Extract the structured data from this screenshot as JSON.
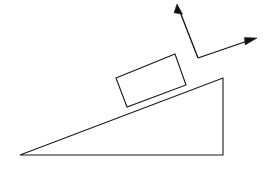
{
  "diagram": {
    "type": "physics-free-body-diagram",
    "canvas": {
      "width": 263,
      "height": 171,
      "background": "#ffffff"
    },
    "stroke_color": "#1a1a1a",
    "vector_color": "#111111",
    "incline": {
      "name": "inclined-plane",
      "shape": "right-triangle",
      "points": "20,155 223,78 223,155",
      "apex_left": {
        "x": 20,
        "y": 155
      },
      "apex_top_right": {
        "x": 223,
        "y": 78
      },
      "corner_bottom_right": {
        "x": 223,
        "y": 155
      },
      "base_label": "",
      "angle_degrees": 21
    },
    "block": {
      "name": "block-on-incline",
      "shape": "rotated-rectangle",
      "points": "116,78 175,54 186,85 127,107",
      "corner_top_left": {
        "x": 116,
        "y": 78
      },
      "corner_top_right": {
        "x": 175,
        "y": 54
      },
      "corner_bottom_right": {
        "x": 186,
        "y": 85
      },
      "corner_bottom_left": {
        "x": 127,
        "y": 107
      },
      "label": ""
    },
    "vectors": [
      {
        "name": "vector-up-left",
        "label": "",
        "origin": {
          "x": 198,
          "y": 58
        },
        "tip": {
          "x": 177,
          "y": 4
        },
        "direction": "up-and-slightly-left",
        "head_width": 7,
        "head_length": 12
      },
      {
        "name": "vector-up-right",
        "label": "",
        "origin": {
          "x": 198,
          "y": 58
        },
        "tip": {
          "x": 257,
          "y": 38
        },
        "direction": "up-and-right",
        "head_width": 7,
        "head_length": 12
      }
    ]
  }
}
